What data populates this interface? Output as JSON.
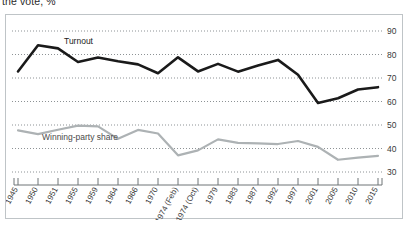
{
  "title": "the vote, %",
  "chart_data": {
    "type": "line",
    "title": "the vote, %",
    "xlabel": "",
    "ylabel": "",
    "ylim": [
      30,
      90
    ],
    "yticks": [
      30,
      40,
      50,
      60,
      70,
      80,
      90
    ],
    "grid": true,
    "legend_position": "inline-annotations",
    "categories": [
      "1945",
      "1950",
      "1951",
      "1955",
      "1959",
      "1964",
      "1966",
      "1970",
      "1974 (Feb)",
      "1974 (Oct)",
      "1979",
      "1983",
      "1987",
      "1992",
      "1997",
      "2001",
      "2005",
      "2010",
      "2015"
    ],
    "series": [
      {
        "name": "Turnout",
        "color": "#1a1a1a",
        "values": [
          72.8,
          83.9,
          82.6,
          76.8,
          78.7,
          77.1,
          75.8,
          72.0,
          78.8,
          72.8,
          76.0,
          72.7,
          75.3,
          77.7,
          71.4,
          59.4,
          61.4,
          65.1,
          66.1
        ]
      },
      {
        "name": "Winning-party share",
        "color": "#adb2b4",
        "values": [
          47.7,
          46.1,
          48.0,
          49.7,
          49.4,
          44.1,
          47.9,
          46.4,
          37.1,
          39.2,
          43.9,
          42.4,
          42.2,
          41.9,
          43.2,
          40.7,
          35.2,
          36.1,
          36.9
        ]
      }
    ],
    "annotations": [
      {
        "text": "Turnout",
        "series": "Turnout"
      },
      {
        "text": "Winning-party share",
        "series": "Winning-party share"
      }
    ]
  }
}
